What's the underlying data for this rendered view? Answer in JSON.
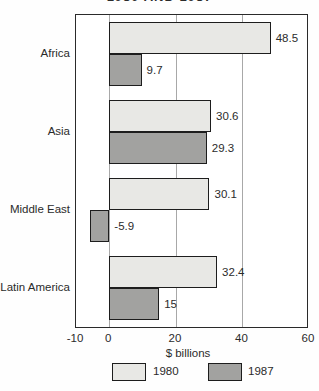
{
  "title_partial": "1980 AND 1987",
  "chart_data": {
    "type": "bar",
    "orientation": "horizontal",
    "title": "1980 AND 1987",
    "title_note": "title clipped at top edge of screenshot",
    "categories": [
      "Africa",
      "Asia",
      "Middle East",
      "Latin America"
    ],
    "series": [
      {
        "name": "1980",
        "color": "#e8e8e5",
        "values": [
          48.5,
          30.6,
          30.1,
          32.4
        ]
      },
      {
        "name": "1987",
        "color": "#a2a2a0",
        "values": [
          9.7,
          29.3,
          -5.9,
          15
        ]
      }
    ],
    "xlabel": "$ billions",
    "xlim": [
      -10,
      60
    ],
    "xticks": [
      -10,
      0,
      20,
      40,
      60
    ],
    "xtick_labels": [
      "-10",
      "0",
      "20",
      "40",
      "60"
    ],
    "gridlines_at": [
      0,
      20,
      40
    ],
    "grid": true,
    "legend_position": "bottom",
    "legend": [
      {
        "label": "1980",
        "color": "#e8e8e5"
      },
      {
        "label": "1987",
        "color": "#a2a2a0"
      }
    ],
    "bar_border_color": "#1d1d1d",
    "frame_border_color": "#2a2a2a",
    "gridline_color": "#a8a8a8",
    "text_color": "#2b2b2b"
  }
}
